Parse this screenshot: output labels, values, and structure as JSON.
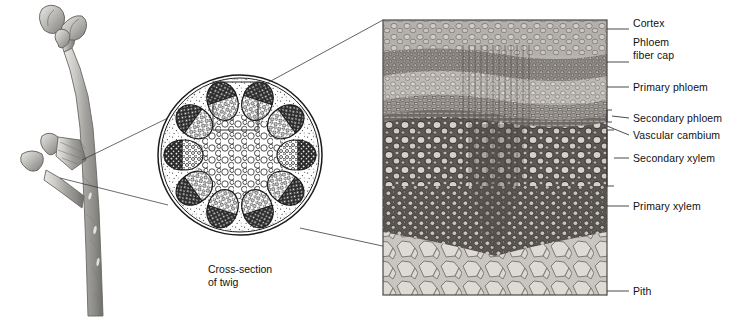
{
  "figure": {
    "panels": [
      {
        "name": "twig-illustration",
        "kind": "drawing"
      },
      {
        "name": "stem-cross-section",
        "kind": "line-drawing"
      },
      {
        "name": "stem-micrograph",
        "kind": "photomicrograph"
      }
    ]
  },
  "caption": {
    "line1": "Cross-section",
    "line2": "of twig"
  },
  "labels": [
    {
      "id": "cortex",
      "text": "Cortex",
      "x": 633,
      "y": 23,
      "leader_y": 29,
      "bracket": false
    },
    {
      "id": "phloem-fiber-cap",
      "text": "Phloem",
      "x": 633,
      "y": 42,
      "leader_y": 62,
      "bracket": false
    },
    {
      "id": "phloem-fiber-cap2",
      "text": "fiber cap",
      "x": 633,
      "y": 55,
      "leader_y": null,
      "bracket": false
    },
    {
      "id": "primary-phloem",
      "text": "Primary phloem",
      "x": 633,
      "y": 81,
      "leader_y": 87,
      "bracket": false
    },
    {
      "id": "secondary-phloem",
      "text": "Secondary phloem",
      "x": 633,
      "y": 113,
      "leader_y": 119,
      "bracket": true
    },
    {
      "id": "vascular-cambium",
      "text": "Vascular cambium",
      "x": 633,
      "y": 130,
      "leader_y": 136,
      "bracket": false
    },
    {
      "id": "secondary-xylem",
      "text": "Secondary xylem",
      "x": 633,
      "y": 152,
      "leader_y": 158,
      "bracket": true
    },
    {
      "id": "primary-xylem",
      "text": "Primary xylem",
      "x": 633,
      "y": 200,
      "leader_y": 206,
      "bracket": false
    },
    {
      "id": "pith",
      "text": "Pith",
      "x": 633,
      "y": 285,
      "leader_y": 291,
      "bracket": false
    }
  ],
  "colors": {
    "ink": "#111111",
    "leader": "#333333",
    "photo_dark": "#4a4a4a",
    "photo_mid": "#8c8c8c",
    "photo_light": "#d8d6d2",
    "twig_gray": "#9a9a96",
    "background": "#ffffff"
  },
  "micrograph": {
    "x": 383,
    "y": 20,
    "width": 224,
    "height": 275,
    "bands": [
      {
        "name": "cortex",
        "from": 0.0,
        "to": 0.13
      },
      {
        "name": "phloem-fiber-cap",
        "from": 0.13,
        "to": 0.21
      },
      {
        "name": "primary-phloem",
        "from": 0.21,
        "to": 0.3
      },
      {
        "name": "secondary-phloem",
        "from": 0.3,
        "to": 0.36
      },
      {
        "name": "vascular-cambium",
        "from": 0.36,
        "to": 0.39
      },
      {
        "name": "secondary-xylem",
        "from": 0.39,
        "to": 0.62
      },
      {
        "name": "primary-xylem",
        "from": 0.62,
        "to": 0.8
      },
      {
        "name": "pith",
        "from": 0.8,
        "to": 1.0
      }
    ]
  },
  "cross_section": {
    "center_x": 240,
    "center_y": 155,
    "radius_x": 80,
    "radius_y": 78,
    "bundle_count": 10,
    "callout_rect": {
      "x": 213,
      "y": 82,
      "width": 45,
      "height": 48
    }
  }
}
